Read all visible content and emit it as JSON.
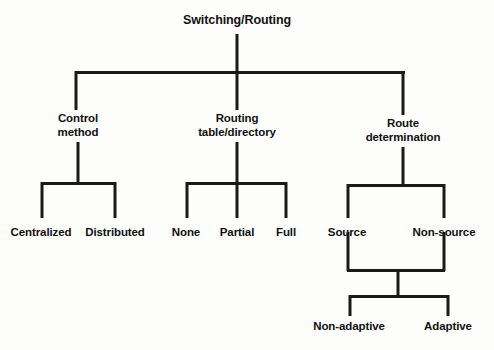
{
  "diagram": {
    "title": "Switching/Routing",
    "type": "hierarchy-tree",
    "colors": {
      "line": "#1a1a1a",
      "text": "#111111",
      "background": "#fdfdfc"
    },
    "nodes": {
      "root": {
        "label": "Switching/Routing",
        "x": 237,
        "y": 14
      },
      "control_method": {
        "label": "Control\nmethod",
        "x": 78,
        "y": 112
      },
      "routing_table": {
        "label": "Routing\ntable/directory",
        "x": 237,
        "y": 112
      },
      "route_determination": {
        "label": "Route\ndetermination",
        "x": 403,
        "y": 117
      },
      "centralized": {
        "label": "Centralized",
        "x": 41,
        "y": 226
      },
      "distributed": {
        "label": "Distributed",
        "x": 115,
        "y": 226
      },
      "none": {
        "label": "None",
        "x": 186,
        "y": 226
      },
      "partial": {
        "label": "Partial",
        "x": 237,
        "y": 226
      },
      "full": {
        "label": "Full",
        "x": 286,
        "y": 226
      },
      "source": {
        "label": "Source",
        "x": 347,
        "y": 226
      },
      "non_source": {
        "label": "Non-source",
        "x": 444,
        "y": 226
      },
      "non_adaptive": {
        "label": "Non-adaptive",
        "x": 349,
        "y": 320
      },
      "adaptive": {
        "label": "Adaptive",
        "x": 448,
        "y": 320
      }
    },
    "edges": {
      "root_stem": {
        "x": 237,
        "y": 34,
        "h": 39
      },
      "level1_bar": {
        "x": 75,
        "y": 71,
        "w": 330
      },
      "branch_left_drop": {
        "x": 76,
        "y": 71,
        "h": 39
      },
      "branch_mid_drop": {
        "x": 237,
        "y": 71,
        "h": 39
      },
      "branch_right_drop": {
        "x": 403,
        "y": 71,
        "h": 44
      },
      "control_stem": {
        "x": 78,
        "y": 142,
        "h": 42
      },
      "control_bar": {
        "x": 41,
        "y": 182,
        "w": 75
      },
      "control_left_drop": {
        "x": 42,
        "y": 182,
        "h": 36
      },
      "control_right_drop": {
        "x": 115,
        "y": 182,
        "h": 36
      },
      "routing_stem": {
        "x": 237,
        "y": 142,
        "h": 42
      },
      "routing_bar": {
        "x": 186,
        "y": 182,
        "w": 101
      },
      "routing_left_drop": {
        "x": 187,
        "y": 182,
        "h": 36
      },
      "routing_mid_drop": {
        "x": 237,
        "y": 182,
        "h": 36
      },
      "routing_right_drop": {
        "x": 286,
        "y": 182,
        "h": 36
      },
      "route_stem": {
        "x": 403,
        "y": 147,
        "h": 38
      },
      "route_bar": {
        "x": 347,
        "y": 184,
        "w": 98
      },
      "route_left_drop": {
        "x": 348,
        "y": 184,
        "h": 34
      },
      "route_right_drop": {
        "x": 444,
        "y": 184,
        "h": 34
      },
      "source_drop": {
        "x": 348,
        "y": 232,
        "h": 39
      },
      "non_source_drop": {
        "x": 444,
        "y": 232,
        "h": 39
      },
      "merge_bar": {
        "x": 347,
        "y": 269,
        "w": 98
      },
      "merge_stem": {
        "x": 398,
        "y": 269,
        "h": 28
      },
      "split_bar": {
        "x": 349,
        "y": 295,
        "w": 100
      },
      "split_left_drop": {
        "x": 350,
        "y": 295,
        "h": 21
      },
      "split_right_drop": {
        "x": 448,
        "y": 295,
        "h": 21
      }
    }
  }
}
